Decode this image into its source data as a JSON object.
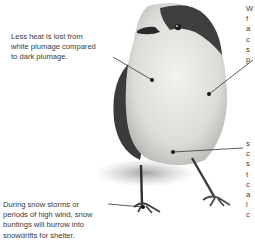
{
  "diagram": {
    "annotations": [
      {
        "id": "plumage",
        "lines": [
          "Less heat is lost from",
          "white plumage compared",
          "to dark plumage."
        ]
      },
      {
        "id": "right-top",
        "lines": [
          "W",
          "f",
          "a",
          "c",
          "s",
          "p"
        ]
      },
      {
        "id": "right-bottom",
        "lines": [
          "s",
          "c",
          "s",
          "t",
          "c",
          "a",
          "l",
          "c"
        ]
      },
      {
        "id": "snowdrift",
        "lines": [
          "During snow storms or",
          "periods of high wind, snow",
          "buntings will burrow into",
          "snowdrifts for shelter."
        ]
      }
    ],
    "colors": {
      "text": "#3a3a3a",
      "leader_line": "#333333",
      "bird_dark": "#3b3b3b",
      "bird_light": "#e9e9e6"
    }
  }
}
